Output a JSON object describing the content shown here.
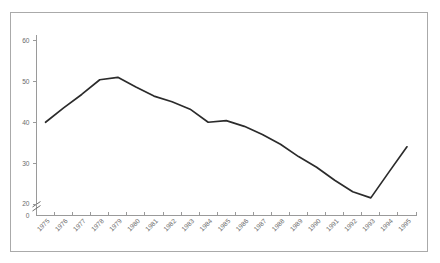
{
  "chart_data": {
    "type": "line",
    "title": "",
    "subtitle": "",
    "xlabel": "",
    "ylabel": "",
    "categories": [
      "1975",
      "1976",
      "1977",
      "1978",
      "1979",
      "1980",
      "1981",
      "1982",
      "1983",
      "1984",
      "1985",
      "1986",
      "1987",
      "1988",
      "1989",
      "1990",
      "1991",
      "1992",
      "1993",
      "1994",
      "1995"
    ],
    "values": [
      40.0,
      43.5,
      46.8,
      50.4,
      51.0,
      48.6,
      46.4,
      45.0,
      43.2,
      40.0,
      40.4,
      39.0,
      37.0,
      34.6,
      31.6,
      29.0,
      25.8,
      23.0,
      21.5,
      27.8,
      34.0
    ],
    "series": [
      {
        "name": "",
        "values": [
          40.0,
          43.5,
          46.8,
          50.4,
          51.0,
          48.6,
          46.4,
          45.0,
          43.2,
          40.0,
          40.4,
          39.0,
          37.0,
          34.6,
          31.6,
          29.0,
          25.8,
          23.0,
          21.5,
          27.8,
          34.0
        ]
      }
    ],
    "ytick_labels": [
      "0",
      "20",
      "30",
      "40",
      "50",
      "60"
    ],
    "ytick_values": [
      0,
      20,
      30,
      40,
      50,
      60
    ],
    "ylim": [
      20,
      60
    ],
    "y_axis_break": true,
    "y_axis_break_label": "axis-break-between-0-and-20",
    "grid": false,
    "legend": null,
    "legend_position": "none",
    "xtick_rotation_degrees": 45,
    "line_color": "#2b2b2b",
    "axis_color": "#9a9a9a",
    "frame_color": "#aaaaaa",
    "background_color": "#ffffff",
    "annotations": []
  },
  "figure": {
    "border_present": true,
    "marker_style": "none"
  }
}
